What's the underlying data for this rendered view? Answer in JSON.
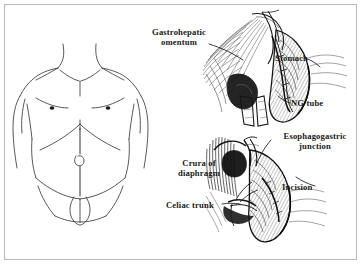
{
  "page": {
    "background_color": "#ffffff",
    "border_color": "#b9b9b9",
    "ink_color": "#1a1a1a",
    "figure_type": "medical-surgical-line-illustration"
  },
  "labels": {
    "gastrohepatic_omentum": "Gastrohepatic\nomentum",
    "stomach": "Stomach",
    "ng_tube": "NG tube",
    "esophagogastric_junction": "Esophagogastric\njunction",
    "crura_of_diaphragm": "Crura of\ndiaphragm",
    "celiac_trunk": "Celiac trunk",
    "incision": "Incision"
  },
  "panels": {
    "torso": {
      "name": "anterior-trunk-surface-anatomy",
      "features": [
        "shoulders",
        "clavicles",
        "nipples",
        "costal-margin",
        "midline-incision-line",
        "umbilicus",
        "inguinal-creases",
        "genitalia"
      ]
    },
    "upper_operative_field": {
      "name": "upper-abdominal-exposure",
      "features": [
        "stomach",
        "gastrohepatic-omentum",
        "nasogastric-tube",
        "retractor-blades",
        "liver-retraction"
      ]
    },
    "lower_operative_field": {
      "name": "esophagogastric-hiatus-exposure",
      "features": [
        "esophagogastric-junction",
        "diaphragmatic-crura",
        "celiac-trunk",
        "incision-line",
        "stomach-fundus"
      ]
    }
  }
}
